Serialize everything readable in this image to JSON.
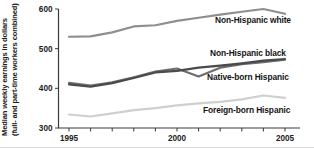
{
  "chart_data": {
    "type": "line",
    "title": "",
    "xlabel": "",
    "ylabel_line1": "Median weekly earnings in dollars",
    "ylabel_line2": "(full- and part-time workers combined)",
    "x": [
      1995,
      1996,
      1997,
      1998,
      1999,
      2000,
      2001,
      2002,
      2003,
      2004,
      2005
    ],
    "xlim": [
      1995,
      2005
    ],
    "ylim": [
      300,
      600
    ],
    "yticks": [
      300,
      400,
      500,
      600
    ],
    "ytick_labels": [
      "300",
      "400",
      "500",
      "600"
    ],
    "xticks": [
      1995,
      1996,
      1997,
      1998,
      1999,
      2000,
      2001,
      2002,
      2003,
      2004,
      2005
    ],
    "xtick_labels": [
      "1995",
      "",
      "",
      "",
      "",
      "2000",
      "",
      "",
      "",
      "",
      "2005"
    ],
    "xtick_labels_shown": [
      "1995",
      "2000",
      "2005"
    ],
    "grid": false,
    "legend_position": "inline-right",
    "series": [
      {
        "name": "Non-Hispanic white",
        "color": "#8e8e8e",
        "values": [
          530,
          531,
          541,
          556,
          559,
          570,
          578,
          586,
          593,
          600,
          588
        ]
      },
      {
        "name": "Non-Hispanic black",
        "color": "#4a4a4a",
        "values": [
          410,
          404,
          413,
          426,
          440,
          444,
          452,
          457,
          463,
          470,
          474
        ]
      },
      {
        "name": "Native-born Hispanic",
        "color": "#6d6d6d",
        "values": [
          414,
          407,
          415,
          428,
          442,
          450,
          430,
          452,
          461,
          466,
          472
        ]
      },
      {
        "name": "Foreign-born Hispanic",
        "color": "#cfcfcf",
        "values": [
          334,
          329,
          337,
          345,
          350,
          357,
          362,
          366,
          372,
          382,
          376
        ]
      }
    ]
  },
  "series_labels": [
    {
      "text": "Non-Hispanic white",
      "x": 215,
      "y": 23
    },
    {
      "text": "Non-Hispanic black",
      "x": 210,
      "y": 56
    },
    {
      "text": "Native-born Hispanic",
      "x": 207,
      "y": 80
    },
    {
      "text": "Foreign-born Hispanic",
      "x": 203,
      "y": 113
    }
  ]
}
